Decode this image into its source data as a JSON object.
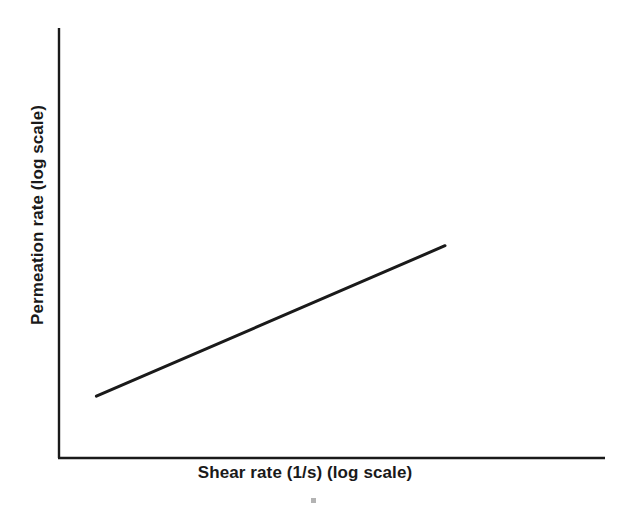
{
  "figure": {
    "background_color": "#ffffff",
    "ink_color": "#1a1a1a"
  },
  "chart_data": {
    "type": "line",
    "title": "",
    "subtitle": "",
    "xlabel": "Shear rate (1/s) (log scale)",
    "ylabel": "Permeation rate (log scale)",
    "x_scale": "log",
    "y_scale": "log",
    "grid": false,
    "legend": null,
    "legend_position": "none",
    "xticks": [],
    "yticks": [],
    "xticklabels": [],
    "yticklabels": [],
    "xlim": [
      0,
      1
    ],
    "ylim": [
      0,
      1
    ],
    "annotations": [],
    "series": [
      {
        "name": "Permeation rate vs shear rate",
        "color": "#1a1a1a",
        "linewidth": 3,
        "marker": "none",
        "x": [
          0.068,
          1.0
        ],
        "y": [
          0.219,
          0.705
        ],
        "description": "Single straight ascending line spanning the lower-left to upper-right of the plot area, indicating a power-law increase of permeation rate with shear rate on log-log axes."
      }
    ]
  },
  "axes": {
    "x_axis_label": "Shear rate (1/s) (log scale)",
    "y_axis_label": "Permeation rate (log scale)",
    "spines": {
      "left": true,
      "bottom": true,
      "top": false,
      "right": false
    }
  },
  "artifact": {
    "name": "scan-speck"
  }
}
